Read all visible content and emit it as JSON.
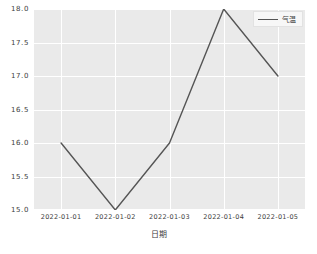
{
  "chart_data": {
    "type": "line",
    "title": "",
    "xlabel": "日期",
    "ylabel": "",
    "categories": [
      "2022-01-01",
      "2022-01-02",
      "2022-01-03",
      "2022-01-04",
      "2022-01-05"
    ],
    "series": [
      {
        "name": "气温",
        "values": [
          16.0,
          15.0,
          16.0,
          18.0,
          17.0
        ],
        "color": "#555555"
      }
    ],
    "ylim": [
      15.0,
      18.0
    ],
    "yticks": [
      "15.0",
      "15.5",
      "16.0",
      "16.5",
      "17.0",
      "17.5",
      "18.0"
    ],
    "ytick_values": [
      15.0,
      15.5,
      16.0,
      16.5,
      17.0,
      17.5,
      18.0
    ],
    "grid": true,
    "legend_position": "upper right",
    "plot_background": "#eaeaea",
    "grid_color": "#ffffff",
    "figure_background": "#ffffff"
  },
  "legend": {
    "entries": [
      {
        "label": "气温"
      }
    ]
  },
  "axes": {
    "x_axis_label": "日期"
  }
}
